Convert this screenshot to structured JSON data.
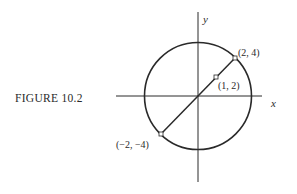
{
  "figure": {
    "caption": "FIGURE 10.2",
    "axes": {
      "x_label": "x",
      "y_label": "y"
    },
    "circle": {
      "center": [
        0,
        0
      ],
      "passes_through": [
        [
          2,
          4
        ],
        [
          -2,
          -4
        ]
      ]
    },
    "diameter": {
      "from": [
        -2,
        -4
      ],
      "to": [
        2,
        4
      ],
      "midpoint_shown": [
        1,
        2
      ]
    },
    "points": [
      {
        "label": "(2, 4)",
        "coords": [
          2,
          4
        ]
      },
      {
        "label": "(1, 2)",
        "coords": [
          1,
          2
        ]
      },
      {
        "label": "(−2, −4)",
        "coords": [
          -2,
          -4
        ]
      }
    ],
    "colors": {
      "ink": "#2a2a2a",
      "background": "#ffffff"
    }
  }
}
